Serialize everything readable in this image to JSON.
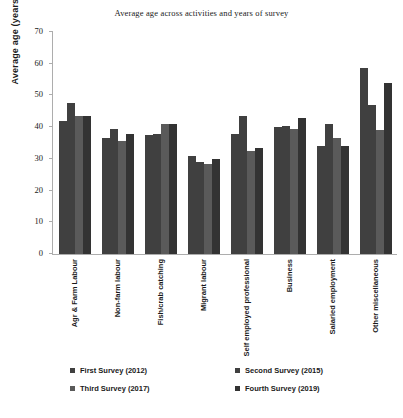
{
  "chart_data": {
    "type": "bar",
    "title": "Average age across activities and years of survey",
    "xlabel": "",
    "ylabel": "Average age (years)",
    "ylim": [
      0,
      70
    ],
    "ytick_step": 10,
    "yticks": [
      70,
      60,
      50,
      40,
      30,
      20,
      10,
      0
    ],
    "grid": false,
    "legend_position": "bottom",
    "categories": [
      "Agr & Farm Labour",
      "Non-farm labour",
      "Fish/crab catching",
      "Migrant labour",
      "Self employed professional",
      "Business",
      "Salaried employment",
      "Other miscellaneous"
    ],
    "series": [
      {
        "name": "First Survey (2012)",
        "color": "#404040",
        "values": [
          42,
          36.5,
          37.5,
          31,
          38,
          40,
          34,
          58.5
        ]
      },
      {
        "name": "Second Survey (2015)",
        "color": "#404040",
        "values": [
          47.5,
          39.5,
          38,
          29,
          43.5,
          40.5,
          41,
          47
        ]
      },
      {
        "name": "Third Survey (2017)",
        "color": "#5a5a5a",
        "values": [
          43.5,
          35.5,
          41,
          28.5,
          32.5,
          39.5,
          36.5,
          39
        ]
      },
      {
        "name": "Fourth Survey (2019)",
        "color": "#333333",
        "values": [
          43.5,
          38,
          41,
          30,
          33.5,
          43,
          34,
          54
        ]
      }
    ]
  }
}
